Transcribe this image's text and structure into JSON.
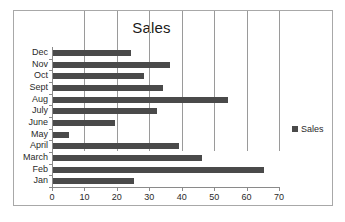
{
  "chart_data": {
    "type": "bar",
    "orientation": "horizontal",
    "title": "Sales",
    "xlabel": "",
    "ylabel": "",
    "xlim": [
      0,
      70
    ],
    "xticks": [
      0,
      10,
      20,
      30,
      40,
      50,
      60,
      70
    ],
    "grid": true,
    "legend": {
      "position": "right",
      "entries": [
        "Sales"
      ]
    },
    "series_name": "Sales",
    "series_color": "#4a4a4a",
    "categories": [
      "Dec",
      "Nov",
      "Oct",
      "Sept",
      "Aug",
      "July",
      "June",
      "May",
      "April",
      "March",
      "Feb",
      "Jan"
    ],
    "values": [
      24,
      36,
      28,
      34,
      54,
      32,
      19,
      5,
      39,
      46,
      65,
      25
    ],
    "points": [
      {
        "category": "Dec",
        "value": 24
      },
      {
        "category": "Nov",
        "value": 36
      },
      {
        "category": "Oct",
        "value": 28
      },
      {
        "category": "Sept",
        "value": 34
      },
      {
        "category": "Aug",
        "value": 54
      },
      {
        "category": "July",
        "value": 32
      },
      {
        "category": "June",
        "value": 19
      },
      {
        "category": "May",
        "value": 5
      },
      {
        "category": "April",
        "value": 39
      },
      {
        "category": "March",
        "value": 46
      },
      {
        "category": "Feb",
        "value": 65
      },
      {
        "category": "Jan",
        "value": 25
      }
    ]
  }
}
